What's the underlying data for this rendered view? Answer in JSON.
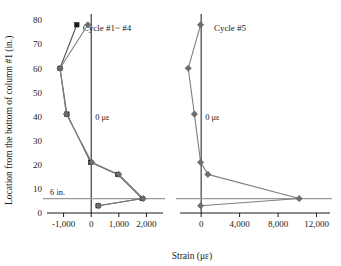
{
  "chart_data": {
    "type": "line",
    "title": "",
    "xlabel": "Strain (με)",
    "ylabel": "Location from the bottom of column #1 (in.)",
    "ylim": [
      0,
      80
    ],
    "yticks": [
      0,
      10,
      20,
      30,
      40,
      50,
      60,
      70,
      80
    ],
    "ytick_labels": [
      "0",
      "10",
      "20",
      "30",
      "40",
      "50",
      "60",
      "70",
      "80"
    ],
    "grid": false,
    "legend_position": "none",
    "orientation": "x=strain, y=location",
    "panels": [
      {
        "name": "left-panel",
        "title": "Cycle #1~ #4",
        "xlim": [
          -1600,
          2600
        ],
        "xticks": [
          -1000,
          0,
          1000,
          2000
        ],
        "xtick_labels": [
          "-1,000",
          "0",
          "1,000",
          "2,000"
        ],
        "zero_line_label": "0 με",
        "reference_line": {
          "label": "6 in.",
          "y_value": 6
        },
        "series": [
          {
            "name": "Cycle #1",
            "marker": "square-dark",
            "color": "#1a1a1a",
            "points": [
              {
                "strain": -520,
                "location": 78
              },
              {
                "strain": -1130,
                "location": 60
              },
              {
                "strain": -880,
                "location": 41
              },
              {
                "strain": -20,
                "location": 21
              },
              {
                "strain": 960,
                "location": 16
              },
              {
                "strain": 1850,
                "location": 6
              },
              {
                "strain": 250,
                "location": 3
              }
            ]
          },
          {
            "name": "Cycle #2~#4",
            "marker": "diamond-gray",
            "color": "#7f7f7f",
            "points": [
              {
                "strain": -120,
                "location": 78
              },
              {
                "strain": -1130,
                "location": 60
              },
              {
                "strain": -900,
                "location": 41
              },
              {
                "strain": 20,
                "location": 21
              },
              {
                "strain": 1000,
                "location": 16
              },
              {
                "strain": 1880,
                "location": 6
              },
              {
                "strain": 260,
                "location": 3
              }
            ]
          }
        ]
      },
      {
        "name": "right-panel",
        "title": "Cycle #5",
        "xlim": [
          -2200,
          13400
        ],
        "xticks": [
          0,
          4000,
          8000,
          12000
        ],
        "xtick_labels": [
          "0",
          "4,000",
          "8,000",
          "12,000"
        ],
        "zero_line_label": "0 με",
        "reference_line": {
          "label": "",
          "y_value": 6
        },
        "series": [
          {
            "name": "Cycle #5",
            "marker": "diamond-gray",
            "color": "#7f7f7f",
            "points": [
              {
                "strain": -60,
                "location": 78
              },
              {
                "strain": -1350,
                "location": 60
              },
              {
                "strain": -700,
                "location": 41
              },
              {
                "strain": -60,
                "location": 21
              },
              {
                "strain": 700,
                "location": 16
              },
              {
                "strain": 10200,
                "location": 6
              },
              {
                "strain": -60,
                "location": 3
              }
            ]
          }
        ]
      }
    ],
    "colors": {
      "axis": "#1a1a1a",
      "series_dark": "#1a1a1a",
      "series_gray": "#7f7f7f",
      "reference_line": "#9a9a9a",
      "background": "#ffffff"
    }
  }
}
